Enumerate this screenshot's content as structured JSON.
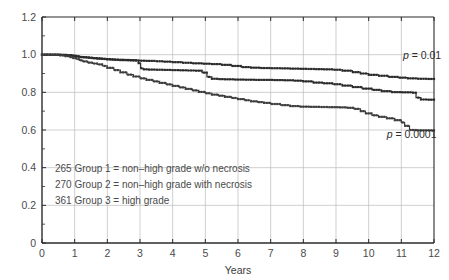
{
  "chart_data": {
    "type": "line",
    "title": "",
    "xlabel": "Years",
    "ylabel": "",
    "xlim": [
      0,
      12
    ],
    "ylim": [
      0,
      1.2
    ],
    "grid": true,
    "legend_position": "inside-lower-left",
    "xticks": [
      "0",
      "1",
      "2",
      "3",
      "4",
      "5",
      "6",
      "7",
      "8",
      "9",
      "10",
      "11",
      "12"
    ],
    "xtick_values": [
      0,
      1,
      2,
      3,
      4,
      5,
      6,
      7,
      8,
      9,
      10,
      11,
      12
    ],
    "yticks": [
      "0",
      "0.2",
      "0.4",
      "0.6",
      "0.8",
      "1.0",
      "1.2"
    ],
    "ytick_values": [
      0,
      0.2,
      0.4,
      0.6,
      0.8,
      1.0,
      1.2
    ],
    "series": [
      {
        "name": "Group 1 = non-high grade w/o necrosis",
        "n": 265,
        "color": "#2b2b2b",
        "marker": "square",
        "x": [
          0,
          0.3,
          0.6,
          0.8,
          0.95,
          1.05,
          1.15,
          1.25,
          1.4,
          1.55,
          1.7,
          1.85,
          2.0,
          2.2,
          2.4,
          2.6,
          2.8,
          3.0,
          3.2,
          3.45,
          3.7,
          4.0,
          4.3,
          4.6,
          4.9,
          5.2,
          5.5,
          5.8,
          6.1,
          6.4,
          6.7,
          7.0,
          7.3,
          7.6,
          7.9,
          8.1,
          8.35,
          8.6,
          8.9,
          9.2,
          9.5,
          9.75,
          10.0,
          10.3,
          10.6,
          10.9,
          11.2,
          11.5,
          11.8,
          12.0
        ],
        "y": [
          1.0,
          1.0,
          0.998,
          0.996,
          0.994,
          0.991,
          0.988,
          0.986,
          0.984,
          0.981,
          0.979,
          0.977,
          0.975,
          0.973,
          0.971,
          0.97,
          0.969,
          0.968,
          0.967,
          0.965,
          0.963,
          0.96,
          0.957,
          0.954,
          0.952,
          0.95,
          0.946,
          0.94,
          0.934,
          0.931,
          0.929,
          0.928,
          0.927,
          0.926,
          0.925,
          0.924,
          0.923,
          0.922,
          0.92,
          0.915,
          0.907,
          0.9,
          0.893,
          0.888,
          0.882,
          0.878,
          0.874,
          0.872,
          0.871,
          0.871
        ]
      },
      {
        "name": "Group 2 = non-high grade with necrosis",
        "n": 270,
        "color": "#2b2b2b",
        "marker": "square",
        "x": [
          0,
          0.3,
          0.55,
          0.75,
          0.9,
          1.0,
          1.1,
          1.2,
          1.35,
          1.5,
          1.65,
          1.8,
          1.95,
          2.1,
          2.3,
          2.5,
          2.7,
          2.88,
          2.95,
          3.02,
          3.1,
          3.25,
          3.45,
          3.7,
          3.95,
          4.2,
          4.45,
          4.7,
          4.9,
          5.05,
          5.2,
          5.4,
          5.6,
          5.9,
          6.2,
          6.5,
          6.8,
          7.1,
          7.4,
          7.7,
          8.0,
          8.3,
          8.6,
          8.9,
          9.2,
          9.5,
          9.8,
          10.1,
          10.4,
          10.7,
          11.0,
          11.2,
          11.35,
          11.45,
          11.6,
          11.8,
          12.0
        ],
        "y": [
          1.0,
          1.0,
          0.999,
          0.997,
          0.995,
          0.992,
          0.989,
          0.987,
          0.985,
          0.982,
          0.98,
          0.978,
          0.976,
          0.974,
          0.973,
          0.972,
          0.971,
          0.97,
          0.955,
          0.928,
          0.922,
          0.921,
          0.92,
          0.919,
          0.918,
          0.917,
          0.916,
          0.915,
          0.905,
          0.882,
          0.872,
          0.87,
          0.869,
          0.868,
          0.867,
          0.866,
          0.866,
          0.865,
          0.864,
          0.862,
          0.858,
          0.852,
          0.848,
          0.843,
          0.836,
          0.828,
          0.82,
          0.813,
          0.806,
          0.801,
          0.8,
          0.8,
          0.798,
          0.772,
          0.762,
          0.761,
          0.761
        ]
      },
      {
        "name": "Group 3 = high grade",
        "n": 361,
        "color": "#3d3d3d",
        "marker": "square",
        "x": [
          0,
          0.25,
          0.5,
          0.7,
          0.85,
          0.95,
          1.05,
          1.15,
          1.25,
          1.4,
          1.55,
          1.7,
          1.85,
          2.0,
          2.2,
          2.4,
          2.6,
          2.8,
          3.0,
          3.2,
          3.4,
          3.6,
          3.8,
          4.0,
          4.2,
          4.4,
          4.6,
          4.8,
          5.0,
          5.2,
          5.4,
          5.6,
          5.8,
          6.0,
          6.2,
          6.4,
          6.6,
          6.8,
          7.0,
          7.3,
          7.6,
          7.9,
          8.2,
          8.5,
          8.8,
          9.1,
          9.35,
          9.55,
          9.75,
          9.9,
          10.1,
          10.3,
          10.55,
          10.8,
          11.0,
          11.1,
          11.25,
          11.5,
          11.75,
          12.0
        ],
        "y": [
          1.0,
          0.999,
          0.996,
          0.992,
          0.987,
          0.982,
          0.976,
          0.97,
          0.964,
          0.958,
          0.953,
          0.948,
          0.94,
          0.93,
          0.918,
          0.906,
          0.894,
          0.884,
          0.874,
          0.866,
          0.858,
          0.85,
          0.842,
          0.834,
          0.826,
          0.818,
          0.81,
          0.802,
          0.795,
          0.788,
          0.782,
          0.776,
          0.77,
          0.764,
          0.758,
          0.752,
          0.748,
          0.744,
          0.738,
          0.732,
          0.727,
          0.724,
          0.723,
          0.722,
          0.721,
          0.72,
          0.718,
          0.712,
          0.7,
          0.688,
          0.678,
          0.67,
          0.662,
          0.652,
          0.64,
          0.622,
          0.6,
          0.598,
          0.598,
          0.598
        ]
      }
    ],
    "annotations": [
      {
        "id": "p-value-group1",
        "text_prefix": "p",
        "text_rest": " = 0.01",
        "x": 11.05,
        "y": 0.975
      },
      {
        "id": "p-value-group3",
        "text_prefix": "p",
        "text_rest": " = 0.0001",
        "x": 10.55,
        "y": 0.555
      }
    ],
    "legend_entries": [
      {
        "count": "265",
        "label": "Group 1 = non–high grade w/o necrosis"
      },
      {
        "count": "270",
        "label": "Group 2 = non–high grade with necrosis"
      },
      {
        "count": "361",
        "label": "Group 3 = high grade"
      }
    ],
    "colors": {
      "axis": "#2b2b2b",
      "grid": "#bcbcbc",
      "text": "#3a3a3a",
      "background": "#ffffff"
    }
  }
}
